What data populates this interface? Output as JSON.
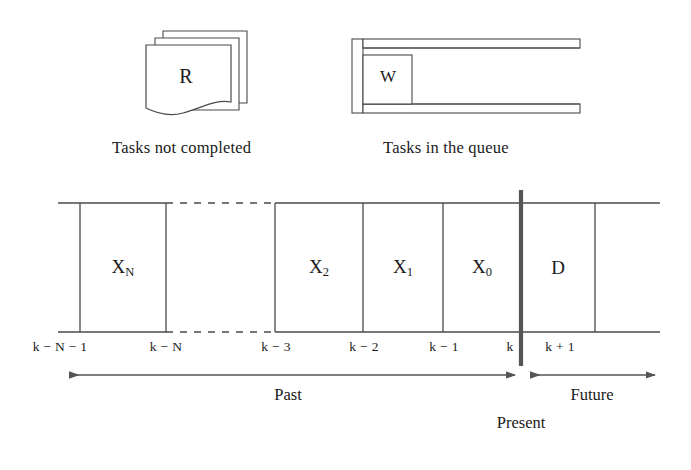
{
  "figure": {
    "stroke_color": "#4a4a4a",
    "accent_color": "#555555",
    "background": "#ffffff"
  },
  "icons": {
    "tasks_not_completed": {
      "glyph": "R",
      "icon_name": "stacked-documents-icon",
      "caption": "Tasks not completed"
    },
    "tasks_in_queue": {
      "glyph": "W",
      "icon_name": "queue-trough-icon",
      "caption": "Tasks in the queue"
    }
  },
  "timeline": {
    "cells": [
      {
        "label": "X",
        "sub": "N",
        "name": "cell-xn"
      },
      {
        "label": "X",
        "sub": "2",
        "name": "cell-x2"
      },
      {
        "label": "X",
        "sub": "1",
        "name": "cell-x1"
      },
      {
        "label": "X",
        "sub": "0",
        "name": "cell-x0"
      },
      {
        "label": "D",
        "sub": "",
        "name": "cell-d"
      }
    ],
    "ticks": [
      {
        "text": "k − N − 1",
        "x": 60
      },
      {
        "text": "k − N",
        "x": 166
      },
      {
        "text": "k − 3",
        "x": 276
      },
      {
        "text": "k − 2",
        "x": 364
      },
      {
        "text": "k − 1",
        "x": 444
      },
      {
        "text": "k",
        "x": 510
      },
      {
        "text": "k + 1",
        "x": 560
      }
    ],
    "past_label": "Past",
    "future_label": "Future",
    "present_label": "Present"
  }
}
